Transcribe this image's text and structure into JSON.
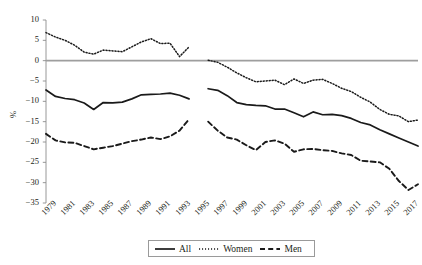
{
  "chart_data": {
    "type": "line",
    "title": "",
    "xlabel": "",
    "ylabel": "%",
    "ylim": [
      -35,
      10
    ],
    "xlim": [
      1979,
      2018
    ],
    "grid": false,
    "zero_line": true,
    "legend_position": "bottom-center",
    "x": [
      1979,
      1980,
      1981,
      1982,
      1983,
      1984,
      1985,
      1986,
      1987,
      1988,
      1989,
      1990,
      1991,
      1992,
      1993,
      1994,
      1996,
      1997,
      1998,
      1999,
      2000,
      2001,
      2002,
      2003,
      2004,
      2005,
      2006,
      2007,
      2008,
      2009,
      2010,
      2011,
      2012,
      2013,
      2014,
      2015,
      2016,
      2017,
      2018
    ],
    "break_after": 1994,
    "break_before": 1996,
    "series": [
      {
        "name": "All",
        "style": "solid",
        "color": "#1a1a1a",
        "values": [
          -7.2,
          -8.8,
          -9.3,
          -9.6,
          -10.4,
          -12.0,
          -10.3,
          -10.4,
          -10.2,
          -9.4,
          -8.4,
          -8.3,
          -8.2,
          -8.0,
          -8.5,
          -9.4,
          -6.9,
          -7.3,
          -8.6,
          -10.3,
          -10.8,
          -11.0,
          -11.1,
          -11.9,
          -11.9,
          -12.8,
          -13.8,
          -12.6,
          -13.3,
          -13.2,
          -13.5,
          -14.2,
          -15.2,
          -15.8,
          -17.0,
          -18.0,
          -19.0,
          -20.0,
          -21.0
        ]
      },
      {
        "name": "Women",
        "style": "dotted",
        "color": "#1a1a1a",
        "values": [
          6.9,
          5.8,
          5.0,
          3.8,
          2.1,
          1.6,
          2.6,
          2.4,
          2.2,
          3.4,
          4.6,
          5.4,
          4.2,
          4.3,
          1.0,
          3.4,
          0.1,
          -0.4,
          -1.6,
          -3.0,
          -4.2,
          -5.2,
          -5.0,
          -4.8,
          -5.9,
          -4.5,
          -5.6,
          -4.8,
          -4.6,
          -5.6,
          -6.8,
          -7.6,
          -9.0,
          -10.2,
          -12.0,
          -13.2,
          -13.6,
          -15.0,
          -14.6
        ]
      },
      {
        "name": "Men",
        "style": "dashed",
        "color": "#1a1a1a",
        "values": [
          -18.0,
          -19.6,
          -20.1,
          -20.2,
          -21.0,
          -21.8,
          -21.4,
          -21.0,
          -20.4,
          -19.8,
          -19.4,
          -18.9,
          -19.3,
          -18.6,
          -17.2,
          -14.4,
          -15.0,
          -17.2,
          -18.9,
          -19.4,
          -20.8,
          -22.0,
          -20.0,
          -19.6,
          -20.4,
          -22.4,
          -21.8,
          -21.7,
          -22.0,
          -22.2,
          -22.8,
          -23.2,
          -24.6,
          -24.8,
          -25.0,
          -26.6,
          -29.6,
          -31.8,
          -30.4
        ]
      }
    ],
    "yticks": [
      10,
      5,
      0,
      -5,
      -10,
      -15,
      -20,
      -25,
      -30,
      -35
    ],
    "ytick_labels": [
      "10",
      "5",
      "0",
      "−5",
      "−10",
      "−15",
      "−20",
      "−25",
      "−30",
      "−35"
    ],
    "xticks": [
      1979,
      1981,
      1983,
      1985,
      1987,
      1989,
      1991,
      1993,
      1995,
      1997,
      1999,
      2001,
      2003,
      2005,
      2007,
      2009,
      2011,
      2013,
      2015,
      2017
    ],
    "xtick_labels": [
      "1979",
      "1981",
      "1983",
      "1985",
      "1987",
      "1989",
      "1991",
      "1993",
      "1995",
      "1997",
      "1999",
      "2001",
      "2003",
      "2005",
      "2007",
      "2009",
      "2011",
      "2013",
      "2015",
      "2017"
    ]
  },
  "legend": {
    "items": [
      {
        "label": "All",
        "style": "solid"
      },
      {
        "label": "Women",
        "style": "dotted"
      },
      {
        "label": "Men",
        "style": "dashed"
      }
    ]
  },
  "colors": {
    "axis": "#8c8c8c",
    "zero_line": "#9e9e9e",
    "series": "#1a1a1a",
    "text": "#231f20",
    "legend_border": "#9a9a9a"
  }
}
